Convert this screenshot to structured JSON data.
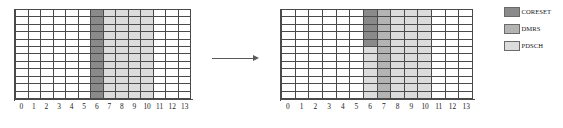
{
  "figure": {
    "title": "",
    "colors": {
      "coreset": "#8a8a8a",
      "dmrs": "#b4b4b4",
      "pdsch": "#dcdcdc",
      "empty": "#ffffff",
      "grid_line": "#4a4a4a",
      "text": "#1b1b1b",
      "arrow": "#5a5a5a"
    },
    "grid": {
      "columns": 14,
      "rows": 12,
      "x_tick_labels": [
        "0",
        "1",
        "2",
        "3",
        "4",
        "5",
        "6",
        "7",
        "8",
        "9",
        "10",
        "11",
        "12",
        "13"
      ]
    },
    "panels": [
      {
        "name": "before",
        "x_tick_labels": [
          "0",
          "1",
          "2",
          "3",
          "4",
          "5",
          "6",
          "7",
          "8",
          "9",
          "10",
          "11",
          "12",
          "13"
        ],
        "cells": [
          [
            "empty",
            "empty",
            "empty",
            "empty",
            "empty",
            "empty",
            "coreset",
            "pdsch",
            "pdsch",
            "pdsch",
            "pdsch",
            "empty",
            "empty",
            "empty"
          ],
          [
            "empty",
            "empty",
            "empty",
            "empty",
            "empty",
            "empty",
            "coreset",
            "pdsch",
            "pdsch",
            "pdsch",
            "pdsch",
            "empty",
            "empty",
            "empty"
          ],
          [
            "empty",
            "empty",
            "empty",
            "empty",
            "empty",
            "empty",
            "coreset",
            "pdsch",
            "pdsch",
            "pdsch",
            "pdsch",
            "empty",
            "empty",
            "empty"
          ],
          [
            "empty",
            "empty",
            "empty",
            "empty",
            "empty",
            "empty",
            "coreset",
            "pdsch",
            "pdsch",
            "pdsch",
            "pdsch",
            "empty",
            "empty",
            "empty"
          ],
          [
            "empty",
            "empty",
            "empty",
            "empty",
            "empty",
            "empty",
            "coreset",
            "pdsch",
            "pdsch",
            "pdsch",
            "pdsch",
            "empty",
            "empty",
            "empty"
          ],
          [
            "empty",
            "empty",
            "empty",
            "empty",
            "empty",
            "empty",
            "coreset",
            "pdsch",
            "pdsch",
            "pdsch",
            "pdsch",
            "empty",
            "empty",
            "empty"
          ],
          [
            "empty",
            "empty",
            "empty",
            "empty",
            "empty",
            "empty",
            "coreset",
            "pdsch",
            "pdsch",
            "pdsch",
            "pdsch",
            "empty",
            "empty",
            "empty"
          ],
          [
            "empty",
            "empty",
            "empty",
            "empty",
            "empty",
            "empty",
            "coreset",
            "pdsch",
            "pdsch",
            "pdsch",
            "pdsch",
            "empty",
            "empty",
            "empty"
          ],
          [
            "empty",
            "empty",
            "empty",
            "empty",
            "empty",
            "empty",
            "coreset",
            "pdsch",
            "pdsch",
            "pdsch",
            "pdsch",
            "empty",
            "empty",
            "empty"
          ],
          [
            "empty",
            "empty",
            "empty",
            "empty",
            "empty",
            "empty",
            "coreset",
            "pdsch",
            "pdsch",
            "pdsch",
            "pdsch",
            "empty",
            "empty",
            "empty"
          ],
          [
            "empty",
            "empty",
            "empty",
            "empty",
            "empty",
            "empty",
            "coreset",
            "pdsch",
            "pdsch",
            "pdsch",
            "pdsch",
            "empty",
            "empty",
            "empty"
          ],
          [
            "empty",
            "empty",
            "empty",
            "empty",
            "empty",
            "empty",
            "coreset",
            "pdsch",
            "pdsch",
            "pdsch",
            "pdsch",
            "empty",
            "empty",
            "empty"
          ]
        ]
      },
      {
        "name": "after",
        "x_tick_labels": [
          "0",
          "1",
          "2",
          "3",
          "4",
          "5",
          "6",
          "7",
          "8",
          "9",
          "10",
          "11",
          "12",
          "13"
        ],
        "cells": [
          [
            "empty",
            "empty",
            "empty",
            "empty",
            "empty",
            "empty",
            "coreset",
            "dmrs",
            "pdsch",
            "pdsch",
            "pdsch",
            "empty",
            "empty",
            "empty"
          ],
          [
            "empty",
            "empty",
            "empty",
            "empty",
            "empty",
            "empty",
            "coreset",
            "dmrs",
            "pdsch",
            "pdsch",
            "pdsch",
            "empty",
            "empty",
            "empty"
          ],
          [
            "empty",
            "empty",
            "empty",
            "empty",
            "empty",
            "empty",
            "coreset",
            "dmrs",
            "pdsch",
            "pdsch",
            "pdsch",
            "empty",
            "empty",
            "empty"
          ],
          [
            "empty",
            "empty",
            "empty",
            "empty",
            "empty",
            "empty",
            "coreset",
            "dmrs",
            "pdsch",
            "pdsch",
            "pdsch",
            "empty",
            "empty",
            "empty"
          ],
          [
            "empty",
            "empty",
            "empty",
            "empty",
            "empty",
            "empty",
            "coreset",
            "dmrs",
            "pdsch",
            "pdsch",
            "pdsch",
            "empty",
            "empty",
            "empty"
          ],
          [
            "empty",
            "empty",
            "empty",
            "empty",
            "empty",
            "empty",
            "pdsch",
            "dmrs",
            "pdsch",
            "pdsch",
            "pdsch",
            "empty",
            "empty",
            "empty"
          ],
          [
            "empty",
            "empty",
            "empty",
            "empty",
            "empty",
            "empty",
            "pdsch",
            "dmrs",
            "pdsch",
            "pdsch",
            "pdsch",
            "empty",
            "empty",
            "empty"
          ],
          [
            "empty",
            "empty",
            "empty",
            "empty",
            "empty",
            "empty",
            "pdsch",
            "dmrs",
            "pdsch",
            "pdsch",
            "pdsch",
            "empty",
            "empty",
            "empty"
          ],
          [
            "empty",
            "empty",
            "empty",
            "empty",
            "empty",
            "empty",
            "pdsch",
            "dmrs",
            "pdsch",
            "pdsch",
            "pdsch",
            "empty",
            "empty",
            "empty"
          ],
          [
            "empty",
            "empty",
            "empty",
            "empty",
            "empty",
            "empty",
            "pdsch",
            "dmrs",
            "pdsch",
            "pdsch",
            "pdsch",
            "empty",
            "empty",
            "empty"
          ],
          [
            "empty",
            "empty",
            "empty",
            "empty",
            "empty",
            "empty",
            "pdsch",
            "dmrs",
            "pdsch",
            "pdsch",
            "pdsch",
            "empty",
            "empty",
            "empty"
          ],
          [
            "empty",
            "empty",
            "empty",
            "empty",
            "empty",
            "empty",
            "pdsch",
            "dmrs",
            "pdsch",
            "pdsch",
            "pdsch",
            "empty",
            "empty",
            "empty"
          ]
        ]
      }
    ],
    "arrow": {
      "direction": "right"
    },
    "legend": {
      "items": [
        {
          "label": "CORESET",
          "color_key": "coreset"
        },
        {
          "label": "DMRS",
          "color_key": "dmrs"
        },
        {
          "label": "PDSCH",
          "color_key": "pdsch"
        }
      ]
    }
  }
}
